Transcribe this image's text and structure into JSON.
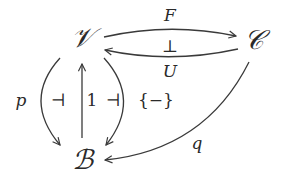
{
  "diagram": {
    "type": "commutative-diagram",
    "nodes": [
      {
        "id": "V",
        "label": "𝒱",
        "x": 82,
        "y": 38
      },
      {
        "id": "C",
        "label": "𝒞",
        "x": 254,
        "y": 40
      },
      {
        "id": "B",
        "label": "ℬ",
        "x": 82,
        "y": 160
      }
    ],
    "edges": [
      {
        "from": "V",
        "to": "C",
        "label": "F"
      },
      {
        "from": "C",
        "to": "V",
        "label": "U"
      },
      {
        "from": "V",
        "to": "B",
        "label": "p"
      },
      {
        "from": "B",
        "to": "V",
        "label": "1"
      },
      {
        "from": "V",
        "to": "B",
        "label": "{−}"
      },
      {
        "from": "C",
        "to": "B",
        "label": "q"
      }
    ],
    "adjunction_marks": {
      "F_U": "⊥",
      "p_1": "⊣",
      "1_set": "⊣"
    }
  }
}
